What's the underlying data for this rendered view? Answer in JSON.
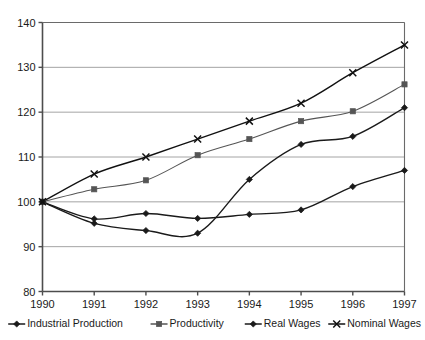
{
  "chart_data": {
    "type": "line",
    "title": "",
    "subtitle": "",
    "xlabel": "",
    "ylabel": "",
    "x": [
      1990,
      1991,
      1992,
      1993,
      1994,
      1995,
      1996,
      1997
    ],
    "categories": [
      "1990",
      "1991",
      "1992",
      "1993",
      "1994",
      "1995",
      "1996",
      "1997"
    ],
    "xlim": [
      1990,
      1997
    ],
    "ylim": [
      80,
      140
    ],
    "y_ticks": [
      80,
      90,
      100,
      110,
      120,
      130,
      140
    ],
    "x_ticks": [
      "1990",
      "1991",
      "1992",
      "1993",
      "1994",
      "1995",
      "1996",
      "1997"
    ],
    "grid": "horizontal",
    "legend_position": "bottom",
    "interpolation": "smooth",
    "series": [
      {
        "name": "Industrial Production",
        "marker": "diamond",
        "color": "#1a1a1a",
        "values": [
          100,
          96.2,
          97.4,
          96.3,
          97.2,
          98.2,
          103.4,
          107.0
        ]
      },
      {
        "name": "Productivity",
        "marker": "square",
        "color": "#555555",
        "values": [
          100,
          102.8,
          104.8,
          110.4,
          114.0,
          118.0,
          120.2,
          126.2
        ]
      },
      {
        "name": "Real Wages",
        "marker": "diamond",
        "color": "#1a1a1a",
        "values": [
          100,
          95.2,
          93.6,
          93.0,
          105.0,
          112.8,
          114.6,
          121.0
        ]
      },
      {
        "name": "Nominal Wages",
        "marker": "cross",
        "color": "#111111",
        "values": [
          100,
          106.2,
          110.0,
          114.0,
          118.0,
          122.0,
          128.8,
          135.0
        ]
      }
    ]
  },
  "legend": {
    "entries": [
      {
        "label": "Industrial Production"
      },
      {
        "label": "Productivity"
      },
      {
        "label": "Real Wages"
      },
      {
        "label": "Nominal Wages"
      }
    ]
  },
  "colors": {
    "background": "#ffffff",
    "grid": "#9a9a9a",
    "axis": "#4d4d4d",
    "text": "#1a1a1a"
  }
}
